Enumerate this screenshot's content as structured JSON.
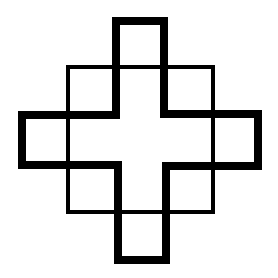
{
  "figure": {
    "type": "geometric-line-drawing",
    "description": "Thick-outlined cross (plus sign) superimposed on a thin-outlined square, forming a stepped diamond pattern",
    "colors": {
      "background": "#ffffff",
      "stroke": "#000000"
    },
    "square": {
      "x": 68,
      "y": 67,
      "width": 145,
      "height": 145,
      "stroke_width": 4
    },
    "cross": {
      "points": "116,21 164,21 164,114 258,114 258,166 166,166 166,260 118,260 118,165 22,165 22,115 116,115",
      "stroke_width": 8
    }
  }
}
